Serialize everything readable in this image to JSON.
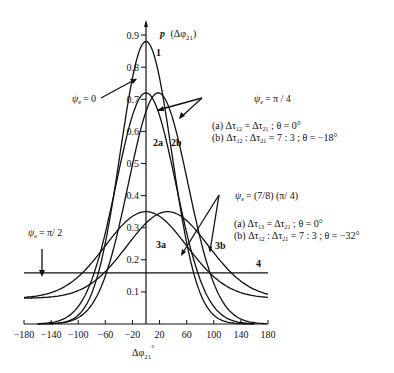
{
  "chart_data": {
    "type": "line",
    "title": "",
    "xlabel": "Δφ21°",
    "ylabel": "p (Δφ21)",
    "xlim": [
      -180,
      180
    ],
    "ylim": [
      0,
      0.95
    ],
    "grid": false,
    "x_ticks": [
      -180,
      -140,
      -100,
      -60,
      -20,
      20,
      60,
      100,
      140,
      180
    ],
    "x_tick_labels": [
      "−180",
      "−140",
      "−100",
      "−60",
      "−20",
      "20",
      "60",
      "100",
      "140",
      "180"
    ],
    "y_ticks": [
      0.1,
      0.2,
      0.3,
      0.4,
      0.5,
      0.6,
      0.7,
      0.8,
      0.9
    ],
    "y_tick_labels": [
      "0.1",
      "0.2",
      "0.3",
      "0.4",
      "0.5",
      "0.6",
      "0.7",
      "0.8",
      "0.9"
    ],
    "series": [
      {
        "name": "1",
        "condition": "ψe = 0",
        "peak_x": 0,
        "peak_y": 0.88,
        "width_deg": 38,
        "tail": 0.0
      },
      {
        "name": "2a",
        "condition": "ψe = π/4; Δτ12 = Δτ21; θ = 0°",
        "peak_x": 0,
        "peak_y": 0.72,
        "width_deg": 44,
        "tail": 0.0
      },
      {
        "name": "2b",
        "condition": "ψe = π/4; Δτ12 : Δτ21 = 7 : 3; θ = −18°",
        "peak_x": 18,
        "peak_y": 0.72,
        "width_deg": 44,
        "tail": 0.0
      },
      {
        "name": "3a",
        "condition": "ψe = (7/8)(π/4); Δτ12 = Δτ21; θ = 0°",
        "peak_x": 0,
        "peak_y": 0.35,
        "width_deg": 60,
        "tail": 0.08
      },
      {
        "name": "3b",
        "condition": "ψe = (7/8)(π/4); Δτ12 : Δτ21 = 7 : 3; θ = −32°",
        "peak_x": 32,
        "peak_y": 0.35,
        "width_deg": 60,
        "tail": 0.08
      },
      {
        "name": "4",
        "condition": "ψe = π/2",
        "constant": 0.159
      }
    ],
    "annotations": [
      {
        "text": "ψe = 0",
        "points_to": "1"
      },
      {
        "text": "ψe = π / 4",
        "points_to": [
          "2a",
          "2b"
        ]
      },
      {
        "text": "(a) Δτ12 = Δτ21 ; θ = 0°"
      },
      {
        "text": "(b) Δτ12 : Δτ21 = 7 : 3 ; θ = −18°"
      },
      {
        "text": "ψe = (7/8) (π/ 4)",
        "points_to": [
          "3a",
          "3b"
        ]
      },
      {
        "text": "(a) Δτ12 = Δτ21 ; θ = 0°"
      },
      {
        "text": "(b) Δτ12 : Δτ21 = 7 : 3 ; θ = −32°"
      },
      {
        "text": "ψe = π/ 2",
        "points_to": "4"
      }
    ]
  },
  "labels": {
    "ylabel_main": "p",
    "ylabel_paren": "(Δφ",
    "ylabel_sub": "21",
    "ylabel_close": ")",
    "xlabel_main": "Δφ",
    "xlabel_sub": "21",
    "xlabel_deg": "°",
    "curve1": "1",
    "curve2a": "2a",
    "curve2b": "2b",
    "curve3a": "3a",
    "curve3b": "3b",
    "curve4": "4",
    "psi0": "= 0",
    "psi_pi4": "= π / 4",
    "g1a": "(a) Δτ",
    "g1a_s1": "12",
    "g1a_m": " = Δτ",
    "g1a_s2": "21",
    "g1a_e": " ; θ = 0°",
    "g1b": "(b) Δτ",
    "g1b_s1": "12",
    "g1b_m": " : Δτ",
    "g1b_s2": "21",
    "g1b_e": " = 7 : 3 ; θ = −18°",
    "psi_78": "= (7/8) (π/ 4)",
    "g2a": "(a) Δτ",
    "g2a_s1": "13",
    "g2a_m": " = Δτ",
    "g2a_s2": "21",
    "g2a_e": " ; θ = 0°",
    "g2b": "(b) Δτ",
    "g2b_s1": "12",
    "g2b_m": " : Δτ",
    "g2b_s2": "21",
    "g2b_e": " = 7 : 3 ; θ = −32°",
    "psi_pi2": "= π/ 2",
    "psi_sym": "ψ",
    "psi_sub": "e"
  }
}
